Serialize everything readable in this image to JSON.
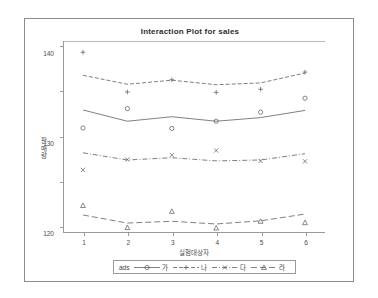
{
  "window": {
    "frame_color": "#8c8c8c",
    "background": "#ffffff"
  },
  "chart_data": {
    "type": "line",
    "title": "Interaction Plot for sales",
    "xlabel": "실험대상자",
    "ylabel": "판매량",
    "x": [
      1,
      2,
      3,
      4,
      5,
      6
    ],
    "xticklabels": [
      "1",
      "2",
      "3",
      "4",
      "5",
      "6"
    ],
    "yticklabels": [
      "100",
      "110",
      "120",
      "130",
      "140"
    ],
    "yticks": [
      100,
      110,
      120,
      130,
      140
    ],
    "xlim": [
      0.55,
      6.45
    ],
    "ylim": [
      98.6,
      141.2
    ],
    "grid": false,
    "legend_position": "bottom",
    "legend_title": "ads",
    "line_color": "#555555",
    "series": [
      {
        "name": "가",
        "marker": "circle",
        "linestyle": "solid",
        "line_values": [
          125.9,
          123.4,
          124.4,
          123.4,
          124.2,
          125.8
        ],
        "point_values": [
          121.9,
          126.2,
          121.8,
          123.4,
          125.4,
          128.5
        ]
      },
      {
        "name": "나",
        "marker": "plus",
        "linestyle": "dashed",
        "line_values": [
          133.6,
          131.6,
          132.5,
          131.5,
          131.9,
          134.1
        ],
        "point_values": [
          138.7,
          129.9,
          132.6,
          129.8,
          130.5,
          134.3
        ]
      },
      {
        "name": "다",
        "marker": "cross",
        "linestyle": "dashdot",
        "line_values": [
          116.4,
          114.8,
          115.3,
          114.6,
          114.8,
          116.2
        ],
        "point_values": [
          112.6,
          114.9,
          115.9,
          116.9,
          114.6,
          114.5
        ]
      },
      {
        "name": "라",
        "marker": "triangle",
        "linestyle": "longdash",
        "line_values": [
          102.6,
          100.8,
          101.2,
          100.6,
          101.3,
          102.8
        ],
        "point_values": [
          104.7,
          99.8,
          103.4,
          99.7,
          101.2,
          100.9
        ]
      }
    ]
  }
}
